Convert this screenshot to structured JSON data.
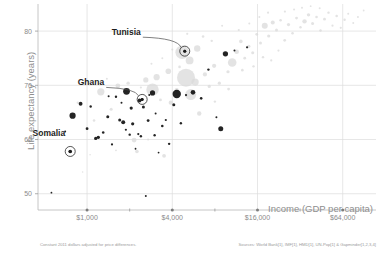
{
  "chart_data": {
    "type": "scatter",
    "title": "",
    "xlabel": "Income (GDP per capita)",
    "ylabel": "Life expectancy (years)",
    "x_scale": "log",
    "x_ticks": [
      1000,
      4000,
      16000,
      64000
    ],
    "x_ticklabels": [
      "$1,000",
      "$4,000",
      "$16,000",
      "$64,000"
    ],
    "x_minor_ticks": [
      2000,
      8000,
      32000
    ],
    "xlim": [
      450,
      110000
    ],
    "y_ticks": [
      50,
      60,
      70,
      80
    ],
    "y_ticklabels": [
      "50",
      "60",
      "70",
      "80"
    ],
    "ylim": [
      47,
      85
    ],
    "grid": true,
    "legend_position": "none",
    "bubble_encoding": "population",
    "series": [
      {
        "name": "Highlighted (dark)",
        "color": "#111111",
        "points": [
          {
            "x": 560,
            "y": 50.2,
            "r": 0.9
          },
          {
            "x": 700,
            "y": 61.5,
            "r": 1.0
          },
          {
            "x": 760,
            "y": 57.8,
            "r": 1.8,
            "label": "Somalia",
            "callout": true
          },
          {
            "x": 790,
            "y": 64.4,
            "r": 3.1
          },
          {
            "x": 900,
            "y": 66.6,
            "r": 1.9
          },
          {
            "x": 1000,
            "y": 62.0,
            "r": 1.4
          },
          {
            "x": 1060,
            "y": 66.1,
            "r": 1.2
          },
          {
            "x": 1150,
            "y": 60.2,
            "r": 1.6
          },
          {
            "x": 1200,
            "y": 60.4,
            "r": 1.7
          },
          {
            "x": 1300,
            "y": 61.3,
            "r": 1.3
          },
          {
            "x": 1400,
            "y": 64.2,
            "r": 1.5
          },
          {
            "x": 1500,
            "y": 59.1,
            "r": 1.1
          },
          {
            "x": 1600,
            "y": 67.9,
            "r": 1.2
          },
          {
            "x": 1700,
            "y": 63.6,
            "r": 1.5
          },
          {
            "x": 1800,
            "y": 63.2,
            "r": 2.0
          },
          {
            "x": 1900,
            "y": 68.9,
            "r": 3.4
          },
          {
            "x": 2000,
            "y": 60.9,
            "r": 1.2
          },
          {
            "x": 2100,
            "y": 62.9,
            "r": 1.6
          },
          {
            "x": 2200,
            "y": 58.3,
            "r": 0.9
          },
          {
            "x": 2300,
            "y": 61.0,
            "r": 1.1
          },
          {
            "x": 2400,
            "y": 60.6,
            "r": 1.2
          },
          {
            "x": 2500,
            "y": 66.0,
            "r": 1.5
          },
          {
            "x": 2600,
            "y": 49.6,
            "r": 1.0
          },
          {
            "x": 2700,
            "y": 63.5,
            "r": 1.4
          },
          {
            "x": 2900,
            "y": 68.6,
            "r": 2.6
          },
          {
            "x": 3000,
            "y": 60.8,
            "r": 1.2
          },
          {
            "x": 3200,
            "y": 57.6,
            "r": 0.9
          },
          {
            "x": 3400,
            "y": 62.5,
            "r": 1.3
          },
          {
            "x": 3600,
            "y": 63.6,
            "r": 1.1
          },
          {
            "x": 3800,
            "y": 59.2,
            "r": 1.2
          },
          {
            "x": 4100,
            "y": 66.4,
            "r": 1.5
          },
          {
            "x": 4300,
            "y": 68.4,
            "r": 4.2
          },
          {
            "x": 4600,
            "y": 63.0,
            "r": 1.2
          },
          {
            "x": 5000,
            "y": 68.2,
            "r": 1.1
          },
          {
            "x": 5600,
            "y": 68.7,
            "r": 2.3
          },
          {
            "x": 6400,
            "y": 67.6,
            "r": 1.3
          },
          {
            "x": 7200,
            "y": 72.9,
            "r": 1.2
          },
          {
            "x": 8200,
            "y": 64.1,
            "r": 1.0
          },
          {
            "x": 9500,
            "y": 75.8,
            "r": 2.6
          },
          {
            "x": 11000,
            "y": 76.4,
            "r": 1.0
          },
          {
            "x": 13500,
            "y": 77.0,
            "r": 1.1
          },
          {
            "x": 2050,
            "y": 65.8,
            "r": 1.6
          },
          {
            "x": 1420,
            "y": 68.0,
            "r": 1.0
          },
          {
            "x": 1750,
            "y": 66.8,
            "r": 1.0
          },
          {
            "x": 8800,
            "y": 62.0,
            "r": 2.5
          },
          {
            "x": 2750,
            "y": 68.2,
            "r": 1.0
          },
          {
            "x": 1880,
            "y": 61.8,
            "r": 1.1
          },
          {
            "x": 3050,
            "y": 64.8,
            "r": 1.0
          },
          {
            "x": 2350,
            "y": 67.2,
            "r": 1.9
          },
          {
            "x": 4900,
            "y": 76.3,
            "r": 1.4,
            "label": "Tunisia",
            "callout": true
          },
          {
            "x": 2450,
            "y": 67.4,
            "r": 1.3,
            "label": "Ghana",
            "callout": true
          }
        ]
      },
      {
        "name": "Other countries (light)",
        "color": "#d9d9d9",
        "points": [
          {
            "x": 1250,
            "y": 68.8,
            "r": 3.6
          },
          {
            "x": 1650,
            "y": 69.9,
            "r": 2.4
          },
          {
            "x": 2150,
            "y": 59.9,
            "r": 2.4
          },
          {
            "x": 2900,
            "y": 69.2,
            "r": 6.2
          },
          {
            "x": 3100,
            "y": 71.5,
            "r": 3.1
          },
          {
            "x": 3500,
            "y": 57.0,
            "r": 1.9
          },
          {
            "x": 3900,
            "y": 66.8,
            "r": 2.1
          },
          {
            "x": 4300,
            "y": 69.1,
            "r": 2.1
          },
          {
            "x": 5000,
            "y": 71.4,
            "r": 9.0
          },
          {
            "x": 5400,
            "y": 68.3,
            "r": 5.5
          },
          {
            "x": 5800,
            "y": 70.6,
            "r": 3.6
          },
          {
            "x": 6200,
            "y": 64.8,
            "r": 2.2
          },
          {
            "x": 6800,
            "y": 72.0,
            "r": 2.1
          },
          {
            "x": 7300,
            "y": 69.8,
            "r": 1.6
          },
          {
            "x": 7900,
            "y": 73.6,
            "r": 2.1
          },
          {
            "x": 8600,
            "y": 70.4,
            "r": 1.6
          },
          {
            "x": 9300,
            "y": 75.9,
            "r": 2.0
          },
          {
            "x": 9900,
            "y": 72.5,
            "r": 1.6
          },
          {
            "x": 10600,
            "y": 74.2,
            "r": 4.3
          },
          {
            "x": 11400,
            "y": 76.2,
            "r": 2.3
          },
          {
            "x": 12200,
            "y": 78.1,
            "r": 1.8
          },
          {
            "x": 13000,
            "y": 75.0,
            "r": 1.4
          },
          {
            "x": 13900,
            "y": 77.2,
            "r": 1.6
          },
          {
            "x": 14800,
            "y": 76.0,
            "r": 1.5
          },
          {
            "x": 15800,
            "y": 79.4,
            "r": 1.4
          },
          {
            "x": 16800,
            "y": 77.8,
            "r": 1.5
          },
          {
            "x": 18000,
            "y": 81.0,
            "r": 3.0
          },
          {
            "x": 19200,
            "y": 79.1,
            "r": 1.6
          },
          {
            "x": 20500,
            "y": 81.6,
            "r": 2.0
          },
          {
            "x": 21800,
            "y": 80.2,
            "r": 1.5
          },
          {
            "x": 23300,
            "y": 82.0,
            "r": 1.3
          },
          {
            "x": 24900,
            "y": 78.3,
            "r": 1.4
          },
          {
            "x": 26500,
            "y": 81.2,
            "r": 1.6
          },
          {
            "x": 28300,
            "y": 79.6,
            "r": 1.3
          },
          {
            "x": 30200,
            "y": 82.4,
            "r": 1.4
          },
          {
            "x": 32200,
            "y": 80.7,
            "r": 1.2
          },
          {
            "x": 34400,
            "y": 81.8,
            "r": 2.2
          },
          {
            "x": 36700,
            "y": 83.0,
            "r": 1.7
          },
          {
            "x": 39200,
            "y": 81.4,
            "r": 1.5
          },
          {
            "x": 41800,
            "y": 82.6,
            "r": 1.3
          },
          {
            "x": 44600,
            "y": 80.1,
            "r": 1.2
          },
          {
            "x": 47600,
            "y": 82.2,
            "r": 1.4
          },
          {
            "x": 50800,
            "y": 83.4,
            "r": 1.2
          },
          {
            "x": 54200,
            "y": 81.0,
            "r": 1.1
          },
          {
            "x": 58000,
            "y": 82.8,
            "r": 1.3
          },
          {
            "x": 62000,
            "y": 80.6,
            "r": 1.1
          },
          {
            "x": 66000,
            "y": 82.1,
            "r": 1.2
          },
          {
            "x": 70000,
            "y": 83.2,
            "r": 1.0
          },
          {
            "x": 76000,
            "y": 81.5,
            "r": 1.0
          },
          {
            "x": 82000,
            "y": 82.6,
            "r": 1.0
          },
          {
            "x": 90000,
            "y": 83.8,
            "r": 0.9
          },
          {
            "x": 4700,
            "y": 76.1,
            "r": 6.8
          },
          {
            "x": 5300,
            "y": 74.6,
            "r": 3.9
          },
          {
            "x": 6000,
            "y": 76.8,
            "r": 3.2
          },
          {
            "x": 3750,
            "y": 72.6,
            "r": 2.8
          },
          {
            "x": 2600,
            "y": 71.0,
            "r": 2.6
          },
          {
            "x": 1950,
            "y": 70.4,
            "r": 1.7
          },
          {
            "x": 1480,
            "y": 65.6,
            "r": 1.5
          },
          {
            "x": 1120,
            "y": 63.5,
            "r": 1.3
          },
          {
            "x": 860,
            "y": 66.8,
            "r": 1.2
          },
          {
            "x": 2250,
            "y": 57.8,
            "r": 1.8
          },
          {
            "x": 3300,
            "y": 67.3,
            "r": 1.4
          },
          {
            "x": 4500,
            "y": 73.4,
            "r": 1.3
          },
          {
            "x": 8000,
            "y": 67.0,
            "r": 1.2
          },
          {
            "x": 10000,
            "y": 69.3,
            "r": 1.4
          },
          {
            "x": 12500,
            "y": 72.8,
            "r": 1.3
          },
          {
            "x": 15000,
            "y": 73.5,
            "r": 1.2
          },
          {
            "x": 17500,
            "y": 75.2,
            "r": 1.2
          },
          {
            "x": 20000,
            "y": 74.6,
            "r": 1.1
          },
          {
            "x": 22500,
            "y": 76.4,
            "r": 1.1
          },
          {
            "x": 25000,
            "y": 83.6,
            "r": 1.1
          },
          {
            "x": 29000,
            "y": 84.0,
            "r": 1.0
          },
          {
            "x": 33000,
            "y": 84.3,
            "r": 1.0
          },
          {
            "x": 19000,
            "y": 83.4,
            "r": 1.1
          },
          {
            "x": 16500,
            "y": 82.6,
            "r": 1.0
          },
          {
            "x": 6600,
            "y": 79.0,
            "r": 1.3
          },
          {
            "x": 7600,
            "y": 78.2,
            "r": 1.2
          },
          {
            "x": 5100,
            "y": 79.5,
            "r": 1.1
          },
          {
            "x": 4000,
            "y": 76.6,
            "r": 1.0
          },
          {
            "x": 3400,
            "y": 75.0,
            "r": 1.0
          },
          {
            "x": 2850,
            "y": 74.0,
            "r": 1.0
          },
          {
            "x": 2400,
            "y": 69.6,
            "r": 1.1
          },
          {
            "x": 1380,
            "y": 71.2,
            "r": 1.0
          },
          {
            "x": 1050,
            "y": 57.2,
            "r": 0.8
          },
          {
            "x": 930,
            "y": 54.0,
            "r": 0.8
          },
          {
            "x": 2700,
            "y": 60.0,
            "r": 1.0
          },
          {
            "x": 1600,
            "y": 58.0,
            "r": 0.9
          },
          {
            "x": 44000,
            "y": 84.2,
            "r": 1.0
          },
          {
            "x": 38000,
            "y": 84.6,
            "r": 0.9
          },
          {
            "x": 11800,
            "y": 80.2,
            "r": 1.1
          },
          {
            "x": 9000,
            "y": 81.0,
            "r": 1.0
          },
          {
            "x": 14000,
            "y": 81.4,
            "r": 1.0
          }
        ]
      }
    ],
    "callouts": [
      {
        "label": "Tunisia",
        "x": 4900,
        "y": 76.3,
        "label_dx": -44,
        "label_dy": -16
      },
      {
        "label": "Ghana",
        "x": 2450,
        "y": 67.4,
        "label_dx": -38,
        "label_dy": -14
      },
      {
        "label": "Somalia",
        "x": 760,
        "y": 57.8,
        "label_dx": -5,
        "label_dy": -16
      }
    ]
  },
  "footnotes": {
    "left": "Constant 2011 dollars adjusted for price differences.",
    "right": "Sources: World Bank[1], IMF[1], HMD[1], UN-Pop[1] & Gapminder[1,2,3,4]"
  }
}
